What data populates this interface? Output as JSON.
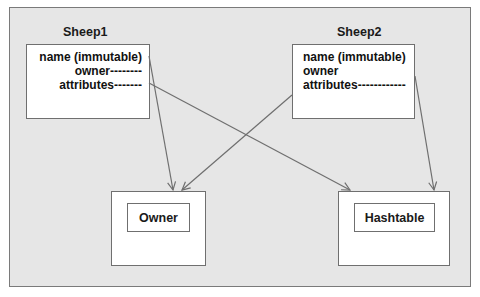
{
  "diagram": {
    "colors": {
      "background": "#e6e6e6",
      "box_fill": "#ffffff",
      "stroke": "#6f6f6f",
      "text": "#1a1a1a"
    },
    "sheep1": {
      "title": "Sheep1",
      "fields": [
        {
          "label": "name (immutable)"
        },
        {
          "label": "owner--------"
        },
        {
          "label": "attributes-------"
        }
      ]
    },
    "sheep2": {
      "title": "Sheep2",
      "fields": [
        {
          "label": "name (immutable)"
        },
        {
          "label": "owner"
        },
        {
          "label": "attributes------------"
        }
      ]
    },
    "owner_box": {
      "label": "Owner"
    },
    "hashtable_box": {
      "label": "Hashtable"
    },
    "edges": [
      {
        "from": "Sheep1.owner",
        "to": "Owner"
      },
      {
        "from": "Sheep1.attributes",
        "to": "Hashtable"
      },
      {
        "from": "Sheep2.owner",
        "to": "Owner"
      },
      {
        "from": "Sheep2.attributes",
        "to": "Hashtable"
      }
    ]
  }
}
